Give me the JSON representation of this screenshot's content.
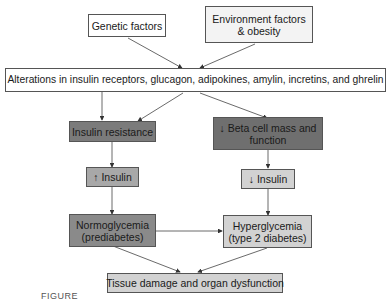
{
  "diagram": {
    "nodes": {
      "genetic": "Genetic factors",
      "environment_line1": "Environment factors",
      "environment_line2": "& obesity",
      "alterations": "Alterations in insulin receptors, glucagon, adipokines, amylin, incretins, and ghrelin",
      "insulin_resistance": "Insulin resistance",
      "beta_cell_line1": "↓ Beta cell mass and",
      "beta_cell_line2": "function",
      "insulin_up": "↑ Insulin",
      "insulin_down": "↓ Insulin",
      "normo_line1": "Normoglycemia",
      "normo_line2": "(prediabetes)",
      "hyper_line1": "Hyperglycemia",
      "hyper_line2": "(type 2 diabetes)",
      "tissue": "Tissue damage and organ dysfunction"
    },
    "edges": [
      [
        "genetic",
        "alterations"
      ],
      [
        "environment",
        "alterations"
      ],
      [
        "alterations",
        "insulin_resistance"
      ],
      [
        "alterations",
        "insulin_resistance"
      ],
      [
        "alterations",
        "beta_cell"
      ],
      [
        "insulin_resistance",
        "insulin_up"
      ],
      [
        "beta_cell",
        "insulin_down"
      ],
      [
        "insulin_up",
        "normo"
      ],
      [
        "insulin_down",
        "hyper"
      ],
      [
        "normo",
        "hyper"
      ],
      [
        "normo",
        "tissue"
      ],
      [
        "hyper",
        "tissue"
      ]
    ],
    "caption": "FIGURE"
  }
}
